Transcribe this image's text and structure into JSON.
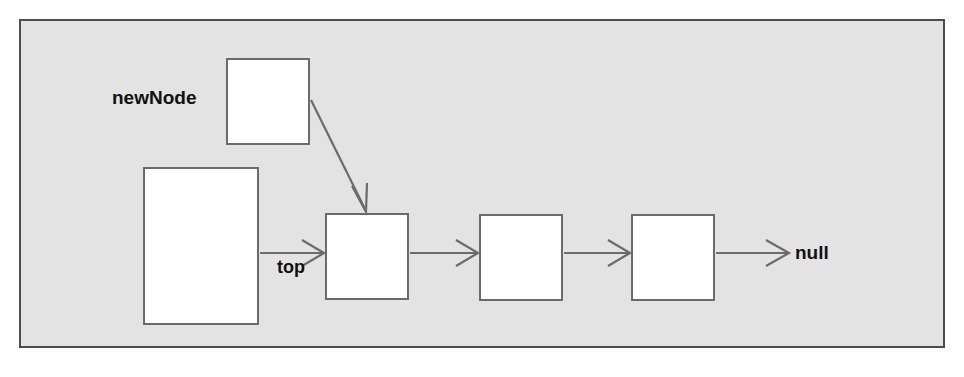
{
  "diagram": {
    "background_color": "#ffffff",
    "panel": {
      "fill": "#e3e3e3",
      "border_color": "#4d4d4d",
      "x": 19,
      "y": 19,
      "width": 926,
      "height": 329
    },
    "style": {
      "box_fill": "#ffffff",
      "box_border": "#6b6b6b",
      "arrow_color": "#6b6b6b",
      "label_color": "#111111",
      "label_font_size": "19px"
    },
    "labels": [
      {
        "id": "newNode",
        "text": "newNode",
        "x": 112,
        "y": 88,
        "font_size": "19px"
      },
      {
        "id": "top",
        "text": "top",
        "x": 277,
        "y": 258,
        "font_size": "18px"
      },
      {
        "id": "null",
        "text": "null",
        "x": 795,
        "y": 243,
        "font_size": "19px"
      }
    ],
    "boxes": [
      {
        "id": "new-node-box",
        "x": 226,
        "y": 58,
        "width": 84,
        "height": 87
      },
      {
        "id": "stack-container-box",
        "x": 143,
        "y": 167,
        "width": 116,
        "height": 158
      },
      {
        "id": "list-node-1",
        "x": 325,
        "y": 213,
        "width": 84,
        "height": 87
      },
      {
        "id": "list-node-2",
        "x": 479,
        "y": 214,
        "width": 84,
        "height": 87
      },
      {
        "id": "list-node-3",
        "x": 631,
        "y": 214,
        "width": 84,
        "height": 87
      }
    ],
    "arrows": [
      {
        "id": "newnode-to-node1",
        "kind": "diagonal",
        "x1": 311,
        "y1": 100,
        "x2": 366,
        "y2": 211
      },
      {
        "id": "top-to-node1",
        "kind": "horizontal",
        "x1": 260,
        "y1": 253,
        "x2": 323,
        "y2": 253
      },
      {
        "id": "node1-to-node2",
        "kind": "horizontal",
        "x1": 410,
        "y1": 253,
        "x2": 477,
        "y2": 253
      },
      {
        "id": "node2-to-node3",
        "kind": "horizontal",
        "x1": 564,
        "y1": 253,
        "x2": 629,
        "y2": 253
      },
      {
        "id": "node3-to-null",
        "kind": "horizontal",
        "x1": 716,
        "y1": 253,
        "x2": 789,
        "y2": 253
      }
    ]
  }
}
